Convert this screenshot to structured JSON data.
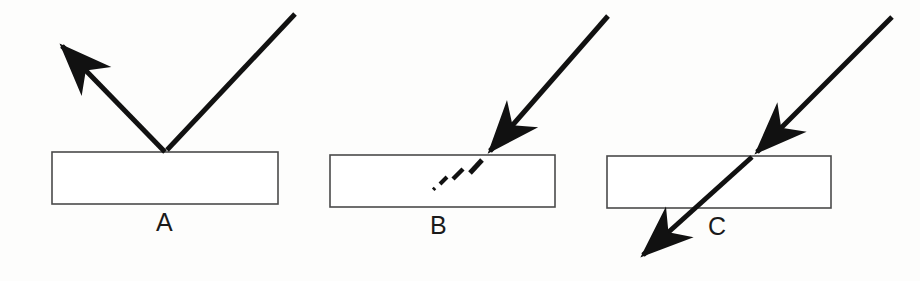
{
  "figure": {
    "background_color": "#fdfdfc",
    "ray_color": "#111111",
    "block_stroke_color": "#4a4a4a",
    "block_fill_color": "#ffffff",
    "label_color": "#1a1a1a",
    "width": 920,
    "height": 281
  },
  "panels": [
    {
      "id": "A",
      "label": "A",
      "phenomenon": "reflection",
      "label_position": {
        "x": 156,
        "y": 210
      },
      "block": {
        "x": 52,
        "y": 152,
        "width": 226,
        "height": 52
      },
      "incidence_point": {
        "x": 165,
        "y": 152
      },
      "rays": [
        {
          "name": "incident-ray",
          "from": {
            "x": 295,
            "y": 14
          },
          "to": {
            "x": 165,
            "y": 152
          },
          "style": "solid",
          "arrowhead": "none",
          "stroke_width": 5
        },
        {
          "name": "reflected-ray",
          "from": {
            "x": 165,
            "y": 152
          },
          "to": {
            "x": 57,
            "y": 41
          },
          "style": "solid",
          "arrowhead": "end",
          "stroke_width": 5
        }
      ],
      "dashes": []
    },
    {
      "id": "B",
      "label": "B",
      "phenomenon": "absorption",
      "label_position": {
        "x": 430,
        "y": 213
      },
      "block": {
        "x": 330,
        "y": 155,
        "width": 225,
        "height": 52
      },
      "incidence_point": {
        "x": 485,
        "y": 156
      },
      "rays": [
        {
          "name": "incident-ray",
          "from": {
            "x": 608,
            "y": 16
          },
          "to": {
            "x": 485,
            "y": 156
          },
          "style": "solid",
          "arrowhead": "end",
          "stroke_width": 5
        }
      ],
      "dashes": [
        {
          "name": "absorbed-dash-1",
          "from": {
            "x": 482,
            "y": 160
          },
          "to": {
            "x": 470,
            "y": 173
          },
          "stroke_width": 5
        },
        {
          "name": "absorbed-dash-2",
          "from": {
            "x": 463,
            "y": 169
          },
          "to": {
            "x": 453,
            "y": 179
          },
          "stroke_width": 4.5
        },
        {
          "name": "absorbed-dash-3",
          "from": {
            "x": 447,
            "y": 177
          },
          "to": {
            "x": 440,
            "y": 184
          },
          "stroke_width": 4
        },
        {
          "name": "absorbed-dot",
          "from": {
            "x": 435,
            "y": 188
          },
          "to": {
            "x": 433,
            "y": 190
          },
          "stroke_width": 3.5
        }
      ]
    },
    {
      "id": "C",
      "label": "C",
      "phenomenon": "transmission",
      "label_position": {
        "x": 708,
        "y": 214
      },
      "block": {
        "x": 607,
        "y": 156,
        "width": 224,
        "height": 52
      },
      "incidence_point": {
        "x": 752,
        "y": 157
      },
      "rays": [
        {
          "name": "incident-ray",
          "from": {
            "x": 892,
            "y": 17
          },
          "to": {
            "x": 752,
            "y": 157
          },
          "style": "solid",
          "arrowhead": "end",
          "stroke_width": 5
        },
        {
          "name": "transmitted-ray",
          "from": {
            "x": 752,
            "y": 157
          },
          "to": {
            "x": 638,
            "y": 259
          },
          "style": "solid",
          "arrowhead": "end",
          "stroke_width": 5
        }
      ],
      "dashes": []
    }
  ]
}
